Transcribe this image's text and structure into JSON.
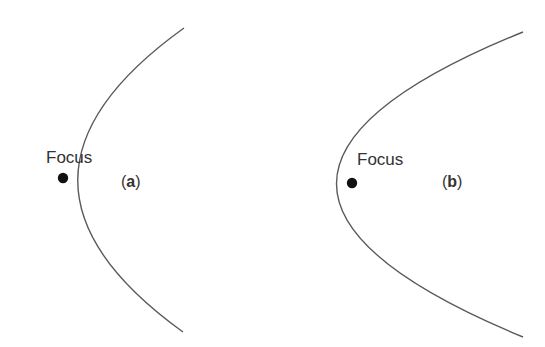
{
  "diagram": {
    "panels": [
      {
        "id": "a",
        "label_open": "(",
        "label_letter": "a",
        "label_close": ")",
        "focus_label": "Focus",
        "curve": {
          "top": [
            184,
            28
          ],
          "vertex": [
            28,
            180
          ],
          "bottom": [
            183,
            332
          ]
        },
        "focus_point": [
          63,
          178
        ]
      },
      {
        "id": "b",
        "label_open": "(",
        "label_letter": "b",
        "label_close": ")",
        "focus_label": "Focus",
        "curve": {
          "top": [
            523,
            32
          ],
          "vertex": [
            336,
            183
          ],
          "bottom": [
            523,
            337
          ]
        },
        "focus_point": [
          352,
          183
        ]
      }
    ],
    "colors": {
      "curve": "#5a5a5a",
      "focus_dot": "#111111",
      "text": "#333333",
      "background": "#ffffff"
    }
  }
}
